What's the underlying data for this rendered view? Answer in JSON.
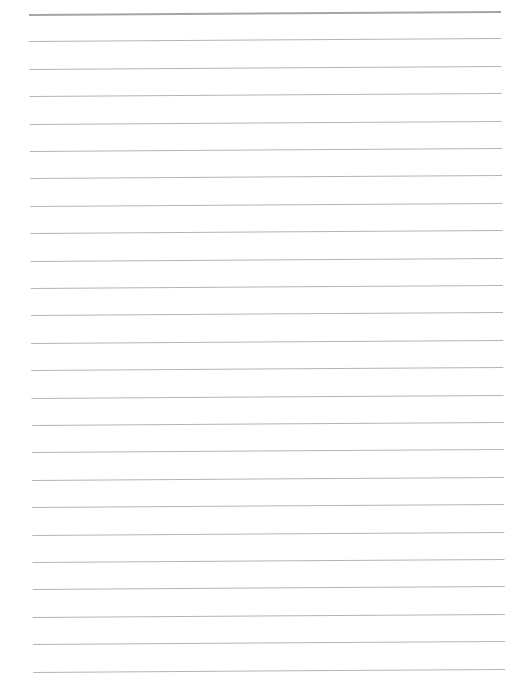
{
  "page": {
    "type": "blank lined paper",
    "line_count": 25,
    "first_line_y": 14,
    "line_spacing": 27.4,
    "line_color": "#b4b4b4",
    "top_line_color": "#a4a4a4",
    "background_color": "#ffffff"
  }
}
